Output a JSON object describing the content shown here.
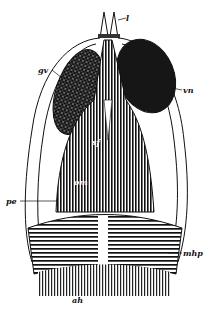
{
  "figure": {
    "labels": {
      "l": "l",
      "gv": "gv",
      "vn": "vn",
      "sf": "sf",
      "om": "om",
      "pe": "pe",
      "mhp": "mhp",
      "ah": "ah"
    },
    "colors": {
      "ink": "#111111",
      "paper": "#ffffff"
    }
  }
}
